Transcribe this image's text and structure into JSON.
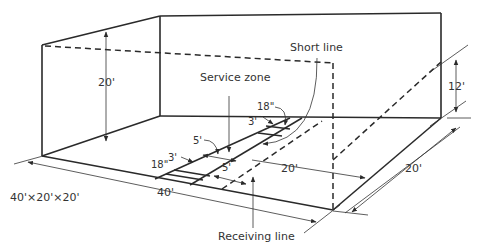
{
  "diagram": {
    "labels": {
      "short_line": "Short line",
      "service_zone": "Service zone",
      "receiving_line": "Receiving line",
      "court_size": "40'×20'×20'"
    },
    "dimensions": {
      "front_wall_height": "20'",
      "back_wall_height": "12'",
      "court_length": "40'",
      "court_width": "20'",
      "short_line_to_back": "20'",
      "service_box_width_top": "18\"",
      "service_box_width_bottom": "18\"",
      "service_box_depth_top": "3'",
      "service_box_depth_bottom": "3'",
      "service_zone_depth": "5'",
      "receiving_line_distance": "5'"
    }
  }
}
